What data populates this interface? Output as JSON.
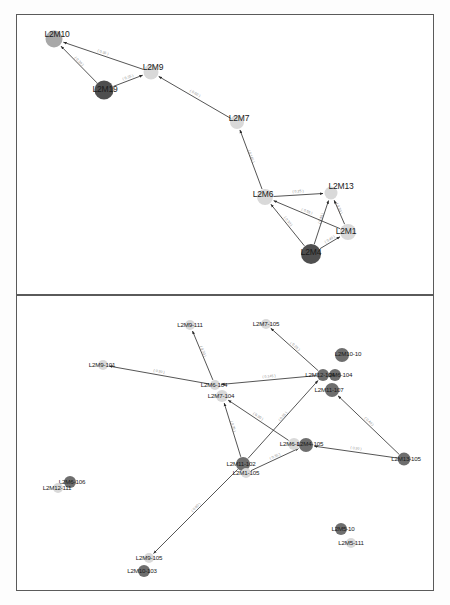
{
  "figure": {
    "type": "network-graph",
    "panel_count": 2,
    "background": "#ffffff",
    "border_color": "#5a5a5a",
    "node_palette": {
      "light": "#d9d9d9",
      "medium": "#a8a8a8",
      "dark": "#6e6e6e",
      "darker": "#4f4f4f"
    },
    "edge_color": "#2a2a2a",
    "edge_label_color": "#7a7a7a"
  },
  "panels": [
    {
      "id": "panel-top",
      "name": "upper-network-panel",
      "nodes": [
        {
          "id": "L2M10",
          "label": "L2M10",
          "x": 53,
          "y": 38,
          "r": 8.5,
          "shade": "medium",
          "lx": 56,
          "ly": 33
        },
        {
          "id": "L2M19",
          "label": "L2M19",
          "x": 103,
          "y": 89,
          "r": 9.5,
          "shade": "darker",
          "lx": 104,
          "ly": 88
        },
        {
          "id": "L2M9",
          "label": "L2M9",
          "x": 150,
          "y": 71,
          "r": 7.5,
          "shade": "light",
          "lx": 152,
          "ly": 66
        },
        {
          "id": "L2M7",
          "label": "L2M7",
          "x": 236,
          "y": 121,
          "r": 7,
          "shade": "light",
          "lx": 238,
          "ly": 117
        },
        {
          "id": "L2M6",
          "label": "L2M6",
          "x": 264,
          "y": 196,
          "r": 8,
          "shade": "light",
          "lx": 262,
          "ly": 193
        },
        {
          "id": "L2M13",
          "label": "L2M13",
          "x": 330,
          "y": 192,
          "r": 6.5,
          "shade": "light",
          "lx": 340,
          "ly": 185
        },
        {
          "id": "L2M1",
          "label": "L2M1",
          "x": 347,
          "y": 231,
          "r": 8,
          "shade": "light",
          "lx": 345,
          "ly": 230
        },
        {
          "id": "L2M4",
          "label": "L2M4",
          "x": 310,
          "y": 253,
          "r": 10,
          "shade": "darker",
          "lx": 310,
          "ly": 251
        }
      ],
      "edges": [
        {
          "from": "L2M9",
          "to": "L2M10",
          "label": "( 0.35 )"
        },
        {
          "from": "L2M19",
          "to": "L2M10",
          "label": "( 0.30 )"
        },
        {
          "from": "L2M19",
          "to": "L2M9",
          "label": "( 0.35 )"
        },
        {
          "from": "L2M7",
          "to": "L2M9",
          "label": "( 0.60 )"
        },
        {
          "from": "L2M6",
          "to": "L2M7",
          "label": "( 0.145 )"
        },
        {
          "from": "L2M6",
          "to": "L2M13",
          "label": "( 0.25 )"
        },
        {
          "from": "L2M4",
          "to": "L2M6",
          "label": "( 0.30 )"
        },
        {
          "from": "L2M1",
          "to": "L2M6",
          "label": "( 0.55 )"
        },
        {
          "from": "L2M4",
          "to": "L2M13",
          "label": "( 0.40 )"
        },
        {
          "from": "L2M1",
          "to": "L2M13",
          "label": "( 0.30 )"
        },
        {
          "from": "L2M4",
          "to": "L2M1",
          "label": "( 0.40 )"
        }
      ]
    },
    {
      "id": "panel-bottom",
      "name": "lower-network-panel",
      "nodes": [
        {
          "id": "L2M9-111",
          "label": "L2M9-111",
          "x": 189,
          "y": 324,
          "r": 5,
          "shade": "light",
          "lx": 189,
          "ly": 323
        },
        {
          "id": "L2M7-105",
          "label": "L2M7-105",
          "x": 265,
          "y": 323,
          "r": 5,
          "shade": "light",
          "lx": 265,
          "ly": 322
        },
        {
          "id": "L2M10-10",
          "label": "L2M10-10",
          "x": 341,
          "y": 354,
          "r": 7,
          "shade": "dark",
          "lx": 347,
          "ly": 352
        },
        {
          "id": "L2M9-101",
          "label": "L2M9-101",
          "x": 102,
          "y": 364,
          "r": 5,
          "shade": "light",
          "lx": 101,
          "ly": 363
        },
        {
          "id": "L2M6-104",
          "label": "L2M6-104",
          "x": 214,
          "y": 384,
          "r": 5,
          "shade": "light",
          "lx": 213,
          "ly": 383
        },
        {
          "id": "L2M6-104b",
          "label": "L2M6-104",
          "x": 334,
          "y": 374,
          "r": 6,
          "shade": "dark",
          "lx": 338,
          "ly": 373
        },
        {
          "id": "L2M12-104",
          "label": "L2M12-104",
          "x": 322,
          "y": 374,
          "r": 6,
          "shade": "dark",
          "lx": 319,
          "ly": 373
        },
        {
          "id": "L2M7-104",
          "label": "L2M7-104",
          "x": 221,
          "y": 395,
          "r": 6,
          "shade": "light",
          "lx": 220,
          "ly": 394
        },
        {
          "id": "L2M11-107",
          "label": "L2M11-107",
          "x": 331,
          "y": 389,
          "r": 7,
          "shade": "dark",
          "lx": 328,
          "ly": 388
        },
        {
          "id": "L2M6-105",
          "label": "L2M6-105",
          "x": 293,
          "y": 443,
          "r": 6,
          "shade": "light",
          "lx": 292,
          "ly": 442
        },
        {
          "id": "L2M4-105",
          "label": "L2M4-105",
          "x": 305,
          "y": 444,
          "r": 7,
          "shade": "dark",
          "lx": 309,
          "ly": 442
        },
        {
          "id": "L2M13-105",
          "label": "L2M13-105",
          "x": 403,
          "y": 458,
          "r": 6.5,
          "shade": "dark",
          "lx": 405,
          "ly": 457
        },
        {
          "id": "L2M11-102",
          "label": "L2M11-102",
          "x": 242,
          "y": 463,
          "r": 7,
          "shade": "dark",
          "lx": 240,
          "ly": 462
        },
        {
          "id": "L2M1-105",
          "label": "L2M1-105",
          "x": 245,
          "y": 472,
          "r": 5,
          "shade": "light",
          "lx": 245,
          "ly": 471
        },
        {
          "id": "L2M6-106",
          "label": "L2M6-106",
          "x": 69,
          "y": 481,
          "r": 6,
          "shade": "dark",
          "lx": 71,
          "ly": 480
        },
        {
          "id": "L2M12-111",
          "label": "L2M12-111",
          "x": 57,
          "y": 487,
          "r": 5,
          "shade": "light",
          "lx": 56,
          "ly": 486
        },
        {
          "id": "L2M5-10",
          "label": "L2M5-10",
          "x": 340,
          "y": 528,
          "r": 6,
          "shade": "dark",
          "lx": 342,
          "ly": 527
        },
        {
          "id": "L2M5-111",
          "label": "L2M5-111",
          "x": 350,
          "y": 542,
          "r": 5,
          "shade": "light",
          "lx": 350,
          "ly": 541
        },
        {
          "id": "L2M9-105",
          "label": "L2M9-105",
          "x": 148,
          "y": 557,
          "r": 5,
          "shade": "light",
          "lx": 148,
          "ly": 556
        },
        {
          "id": "L2M10-103",
          "label": "L2M10-103",
          "x": 143,
          "y": 570,
          "r": 6,
          "shade": "dark",
          "lx": 141,
          "ly": 569
        }
      ],
      "edges": [
        {
          "from": "L2M6-104",
          "to": "L2M9-111",
          "label": "( 0.30 )"
        },
        {
          "from": "L2M12-104",
          "to": "L2M7-105",
          "label": "( 0.25 )"
        },
        {
          "from": "L2M6-104",
          "to": "L2M9-101",
          "label": "( 0.30 )"
        },
        {
          "from": "L2M12-104",
          "to": "L2M6-104",
          "label": "( 0.145 )"
        },
        {
          "from": "L2M11-102",
          "to": "L2M7-104",
          "label": "( 0.35 )"
        },
        {
          "from": "L2M11-102",
          "to": "L2M12-104",
          "label": "( 0.55 )"
        },
        {
          "from": "L2M6-105",
          "to": "L2M7-104",
          "label": "( 0.30 )"
        },
        {
          "from": "L2M13-105",
          "to": "L2M11-107",
          "label": "( 0.40 )"
        },
        {
          "from": "L2M13-105",
          "to": "L2M4-105",
          "label": "( 0.30 )"
        },
        {
          "from": "L2M11-102",
          "to": "L2M9-105",
          "label": "( 0.60 )"
        },
        {
          "from": "L2M1-105",
          "to": "L2M4-105",
          "label": "( 0.35 )"
        }
      ]
    }
  ]
}
